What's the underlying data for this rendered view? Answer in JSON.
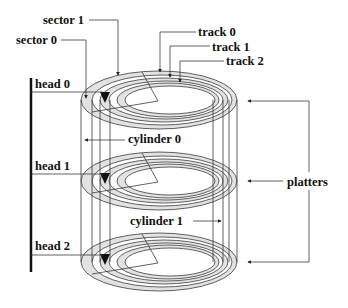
{
  "diagram": {
    "type": "disk-geometry",
    "labels": {
      "sector_0": "sector 0",
      "sector_1": "sector 1",
      "track_0": "track 0",
      "track_1": "track 1",
      "track_2": "track 2",
      "head_0": "head 0",
      "head_1": "head 1",
      "head_2": "head 2",
      "cylinder_0": "cylinder 0",
      "cylinder_1": "cylinder 1",
      "platters": "platters"
    },
    "platters": [
      {
        "name": "platter-0",
        "head": "head 0",
        "cy": 100
      },
      {
        "name": "platter-1",
        "head": "head 1",
        "cy": 181
      },
      {
        "name": "platter-2",
        "head": "head 2",
        "cy": 262
      }
    ],
    "tracks_per_platter": 3,
    "colors": {
      "ring_fill": "#e2e2e2",
      "line": "#3a3a3a",
      "text": "#111111",
      "head_bar": "#111111"
    }
  }
}
